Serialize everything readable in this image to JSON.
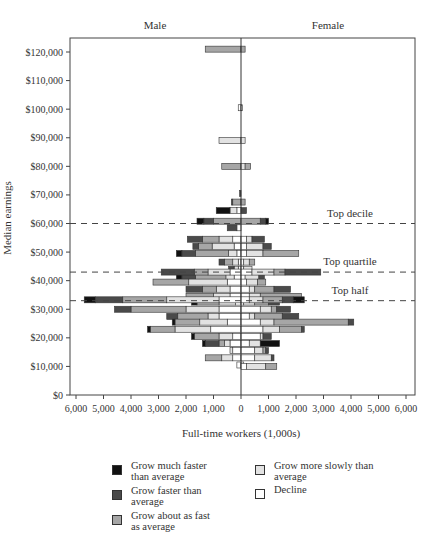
{
  "chart_data": {
    "type": "bar",
    "orientation": "horizontal-butterfly",
    "xlabel": "Full-time workers (1,000s)",
    "ylabel": "Median earnings",
    "panel_labels": {
      "left": "Male",
      "right": "Female"
    },
    "x_ticks": [
      "6,000",
      "5,000",
      "4,000",
      "3,000",
      "2,000",
      "1,000",
      "0",
      "1,000",
      "2,000",
      "3,000",
      "4,000",
      "5,000",
      "6,000"
    ],
    "x_tick_values": [
      -6000,
      -5000,
      -4000,
      -3000,
      -2000,
      -1000,
      0,
      1000,
      2000,
      3000,
      4000,
      5000,
      6000
    ],
    "xlim": [
      -6200,
      6200
    ],
    "y_ticks": [
      "$0",
      "$10,000",
      "$20,000",
      "$30,000",
      "$40,000",
      "$50,000",
      "$60,000",
      "$70,000",
      "$80,000",
      "$90,000",
      "$100,000",
      "$110,000",
      "$120,000"
    ],
    "y_tick_values": [
      0,
      10000,
      20000,
      30000,
      40000,
      50000,
      60000,
      70000,
      80000,
      90000,
      100000,
      110000,
      120000
    ],
    "ylim": [
      0,
      125000
    ],
    "reference_lines": [
      {
        "label": "Top decile",
        "value": 60000
      },
      {
        "label": "Top quartile",
        "value": 43000
      },
      {
        "label": "Top half",
        "value": 33000
      }
    ],
    "categories": [
      "Decline",
      "Grow more slowly than average",
      "Grow about as fast as average",
      "Grow faster than average",
      "Grow much faster than average"
    ],
    "colors": {
      "Decline": "#ffffff",
      "Grow more slowly than average": "#e2e2e2",
      "Grow about as fast as average": "#a6a6a6",
      "Grow faster than average": "#4a4a4a",
      "Grow much faster than average": "#111111"
    },
    "rows": [
      {
        "earnings": 121000,
        "male": [
          0,
          0,
          1300,
          0,
          0
        ],
        "female": [
          0,
          0,
          150,
          0,
          0
        ]
      },
      {
        "earnings": 100500,
        "male": [
          100,
          0,
          0,
          0,
          0
        ],
        "female": [
          50,
          0,
          0,
          0,
          0
        ]
      },
      {
        "earnings": 89000,
        "male": [
          0,
          800,
          0,
          0,
          0
        ],
        "female": [
          0,
          150,
          0,
          0,
          0
        ]
      },
      {
        "earnings": 80000,
        "male": [
          0,
          0,
          700,
          0,
          0
        ],
        "female": [
          0,
          150,
          200,
          0,
          0
        ]
      },
      {
        "earnings": 70500,
        "male": [
          0,
          0,
          0,
          50,
          0
        ],
        "female": [
          0,
          0,
          0,
          0,
          0
        ]
      },
      {
        "earnings": 67500,
        "male": [
          0,
          0,
          300,
          50,
          0
        ],
        "female": [
          0,
          0,
          150,
          0,
          0
        ]
      },
      {
        "earnings": 64500,
        "male": [
          150,
          250,
          0,
          0,
          500
        ],
        "female": [
          0,
          0,
          0,
          200,
          0
        ]
      },
      {
        "earnings": 60800,
        "male": [
          0,
          0,
          1000,
          350,
          250
        ],
        "female": [
          0,
          0,
          700,
          200,
          100
        ]
      },
      {
        "earnings": 58500,
        "male": [
          150,
          0,
          0,
          350,
          0
        ],
        "female": [
          0,
          0,
          0,
          0,
          0
        ]
      },
      {
        "earnings": 54500,
        "male": [
          300,
          500,
          600,
          550,
          0
        ],
        "female": [
          200,
          200,
          0,
          450,
          0
        ]
      },
      {
        "earnings": 52000,
        "male": [
          250,
          800,
          500,
          200,
          0
        ],
        "female": [
          200,
          600,
          0,
          300,
          0
        ]
      },
      {
        "earnings": 49500,
        "male": [
          150,
          300,
          1200,
          500,
          200
        ],
        "female": [
          200,
          600,
          1300,
          0,
          0
        ]
      },
      {
        "earnings": 46500,
        "male": [
          100,
          200,
          300,
          200,
          0
        ],
        "female": [
          100,
          200,
          200,
          0,
          0
        ]
      },
      {
        "earnings": 44000,
        "male": [
          100,
          150,
          0,
          200,
          0
        ],
        "female": [
          100,
          300,
          0,
          0,
          0
        ]
      },
      {
        "earnings": 41500,
        "male": [
          250,
          300,
          1100,
          500,
          200
        ],
        "female": [
          150,
          500,
          0,
          200,
          0
        ]
      },
      {
        "earnings": 43000,
        "male": [
          400,
          800,
          500,
          1200,
          0
        ],
        "female": [
          400,
          800,
          400,
          1300,
          0
        ]
      },
      {
        "earnings": 39500,
        "male": [
          500,
          1400,
          1300,
          0,
          0
        ],
        "female": [
          200,
          400,
          300,
          0,
          0
        ]
      },
      {
        "earnings": 37000,
        "male": [
          400,
          500,
          500,
          600,
          0
        ],
        "female": [
          300,
          200,
          700,
          600,
          0
        ]
      },
      {
        "earnings": 34500,
        "male": [
          400,
          600,
          1000,
          0,
          0
        ],
        "female": [
          300,
          400,
          1500,
          0,
          0
        ]
      },
      {
        "earnings": 32500,
        "male": [
          200,
          600,
          800,
          0,
          200
        ],
        "female": [
          100,
          400,
          500,
          400,
          0
        ]
      },
      {
        "earnings": 33300,
        "male": [
          800,
          1900,
          1600,
          1000,
          400
        ],
        "female": [
          300,
          500,
          700,
          400,
          400
        ]
      },
      {
        "earnings": 30000,
        "male": [
          800,
          1200,
          2000,
          600,
          0
        ],
        "female": [
          700,
          400,
          200,
          500,
          0
        ]
      },
      {
        "earnings": 27500,
        "male": [
          800,
          400,
          1100,
          400,
          0
        ],
        "female": [
          300,
          200,
          1000,
          600,
          0
        ]
      },
      {
        "earnings": 25500,
        "male": [
          500,
          1000,
          900,
          0,
          100
        ],
        "female": [
          700,
          500,
          2700,
          200,
          0
        ]
      },
      {
        "earnings": 23000,
        "male": [
          1100,
          1300,
          900,
          0,
          100
        ],
        "female": [
          800,
          600,
          800,
          100,
          0
        ]
      },
      {
        "earnings": 20500,
        "male": [
          300,
          500,
          900,
          0,
          100
        ],
        "female": [
          700,
          100,
          0,
          300,
          0
        ]
      },
      {
        "earnings": 18000,
        "male": [
          400,
          200,
          200,
          500,
          100
        ],
        "female": [
          300,
          400,
          0,
          0,
          700
        ]
      },
      {
        "earnings": 15500,
        "male": [
          300,
          100,
          0,
          0,
          0
        ],
        "female": [
          500,
          300,
          100,
          100,
          0
        ]
      },
      {
        "earnings": 13000,
        "male": [
          300,
          400,
          600,
          0,
          0
        ],
        "female": [
          500,
          600,
          0,
          100,
          0
        ]
      },
      {
        "earnings": 10500,
        "male": [
          150,
          0,
          0,
          0,
          0
        ],
        "female": [
          100,
          0,
          0,
          0,
          0
        ]
      },
      {
        "earnings": 10000,
        "male": [
          0,
          0,
          0,
          0,
          0
        ],
        "female": [
          200,
          700,
          400,
          0,
          0
        ]
      }
    ]
  },
  "legend": {
    "items": [
      {
        "label": "Grow much faster than average",
        "key": "Grow much faster than average"
      },
      {
        "label": "Grow faster than average",
        "key": "Grow faster than average"
      },
      {
        "label": "Grow about as fast as average",
        "key": "Grow about as fast as average"
      },
      {
        "label": "Grow more slowly than average",
        "key": "Grow more slowly than average"
      },
      {
        "label": "Decline",
        "key": "Decline"
      }
    ]
  }
}
